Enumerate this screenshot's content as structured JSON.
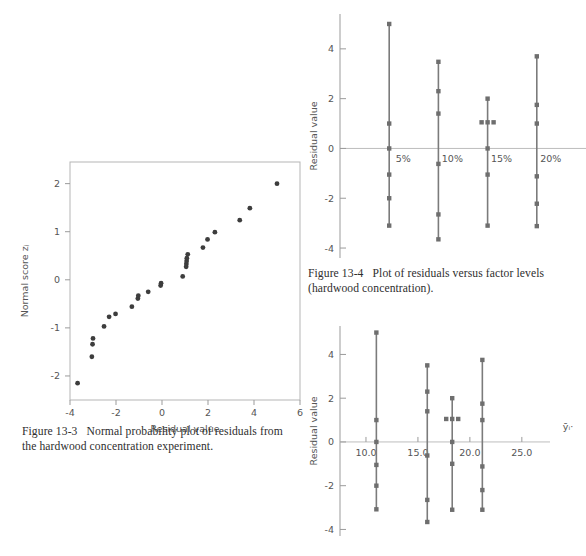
{
  "page": {
    "background": "#ffffff",
    "text_color": "#2b2b2b"
  },
  "figures": [
    {
      "id": "figure-13-3",
      "caption_number": "Figure 13-3",
      "caption_text": "Normal probability plot of residuals from the hardwood concentration experiment."
    },
    {
      "id": "figure-13-4",
      "caption_number": "Figure 13-4",
      "caption_text": "Plot of residuals versus factor levels (hardwood concentration)."
    }
  ],
  "chart_data": [
    {
      "id": "normal-probability-plot",
      "type": "scatter",
      "title": "",
      "xlabel": "Residual value",
      "ylabel": "Normal score zⱼ",
      "xlim": [
        -4,
        6
      ],
      "ylim": [
        -2.5,
        2.45
      ],
      "xticks": [
        -4,
        -2,
        0,
        2,
        4,
        6
      ],
      "xtick_labels": [
        "-4",
        "-2",
        "0",
        "2",
        "4",
        "6"
      ],
      "yticks": [
        -2,
        -1,
        0,
        1,
        2
      ],
      "ytick_labels": [
        "-2",
        "-1",
        "0",
        "1",
        "2"
      ],
      "grid": false,
      "legend": "none",
      "marker": "circle",
      "marker_color": "#3d3d3d",
      "points": [
        {
          "x": -3.67,
          "y": -2.15
        },
        {
          "x": -3.05,
          "y": -1.6
        },
        {
          "x": -3.02,
          "y": -1.34
        },
        {
          "x": -3.0,
          "y": -1.22
        },
        {
          "x": -2.52,
          "y": -0.97
        },
        {
          "x": -2.3,
          "y": -0.77
        },
        {
          "x": -2.02,
          "y": -0.71
        },
        {
          "x": -1.31,
          "y": -0.56
        },
        {
          "x": -1.05,
          "y": -0.39
        },
        {
          "x": -1.03,
          "y": -0.33
        },
        {
          "x": -0.6,
          "y": -0.25
        },
        {
          "x": -0.06,
          "y": -0.12
        },
        {
          "x": -0.04,
          "y": -0.07
        },
        {
          "x": 0.9,
          "y": 0.07
        },
        {
          "x": 1.05,
          "y": 0.27
        },
        {
          "x": 1.06,
          "y": 0.33
        },
        {
          "x": 1.07,
          "y": 0.39
        },
        {
          "x": 1.08,
          "y": 0.45
        },
        {
          "x": 1.12,
          "y": 0.53
        },
        {
          "x": 1.78,
          "y": 0.67
        },
        {
          "x": 1.98,
          "y": 0.84
        },
        {
          "x": 2.3,
          "y": 0.99
        },
        {
          "x": 3.38,
          "y": 1.24
        },
        {
          "x": 3.82,
          "y": 1.49
        },
        {
          "x": 5.0,
          "y": 2.0
        }
      ]
    },
    {
      "id": "residuals-vs-factor-levels",
      "type": "scatter",
      "title": "",
      "xlabel": "",
      "ylabel": "Residual value",
      "xlim": [
        0,
        5
      ],
      "ylim": [
        -4.4,
        5.4
      ],
      "yticks": [
        -4,
        -2,
        0,
        2,
        4
      ],
      "ytick_labels": [
        "-4",
        "-2",
        "0",
        "2",
        "4"
      ],
      "category_labels": [
        "5%",
        "10%",
        "15%",
        "20%"
      ],
      "grid": false,
      "legend": "none",
      "marker": "square",
      "marker_color": "#6e6e6e",
      "zero_line": true,
      "groups": [
        {
          "label": "5%",
          "x": 1.0,
          "values": [
            5.0,
            1.0,
            0.0,
            -1.05,
            -2.0,
            -3.1
          ]
        },
        {
          "label": "10%",
          "x": 2.0,
          "values": [
            3.48,
            2.3,
            1.4,
            -0.62,
            -2.65,
            -3.65
          ]
        },
        {
          "label": "15%",
          "x": 3.0,
          "values": [
            2.0,
            1.05,
            1.05,
            0.0,
            -1.05,
            -3.1
          ]
        },
        {
          "label": "20%",
          "x": 4.0,
          "values": [
            3.7,
            1.75,
            1.0,
            -1.12,
            -2.22,
            -3.12
          ]
        }
      ]
    },
    {
      "id": "residuals-vs-fitted-values",
      "type": "scatter",
      "title": "",
      "xlabel": "ȳᵢ·",
      "ylabel": "Residual value",
      "xlim": [
        7.5,
        28.0
      ],
      "ylim": [
        -4.3,
        5.3
      ],
      "xticks": [
        10.0,
        15.0,
        20.0,
        25.0
      ],
      "xtick_labels": [
        "10.0",
        "15.0",
        "20.0",
        "25.0"
      ],
      "yticks": [
        -4,
        -2,
        0,
        2,
        4
      ],
      "ytick_labels": [
        "-4",
        "-2",
        "0",
        "2",
        "4"
      ],
      "grid": false,
      "legend": "none",
      "marker": "square",
      "marker_color": "#6e6e6e",
      "zero_line": true,
      "groups": [
        {
          "label": "11.0",
          "x": 11.0,
          "values": [
            5.0,
            1.0,
            0.0,
            -1.05,
            -2.0,
            -3.08
          ]
        },
        {
          "label": "15.9",
          "x": 15.9,
          "values": [
            3.5,
            2.3,
            1.4,
            -0.62,
            -2.65,
            -3.66
          ]
        },
        {
          "label": "18.3",
          "x": 18.3,
          "values": [
            2.0,
            1.05,
            1.05,
            0.0,
            -1.0,
            -3.1
          ]
        },
        {
          "label": "21.2",
          "x": 21.2,
          "values": [
            3.75,
            1.75,
            1.0,
            -1.12,
            -2.2,
            -3.1
          ]
        }
      ]
    }
  ]
}
